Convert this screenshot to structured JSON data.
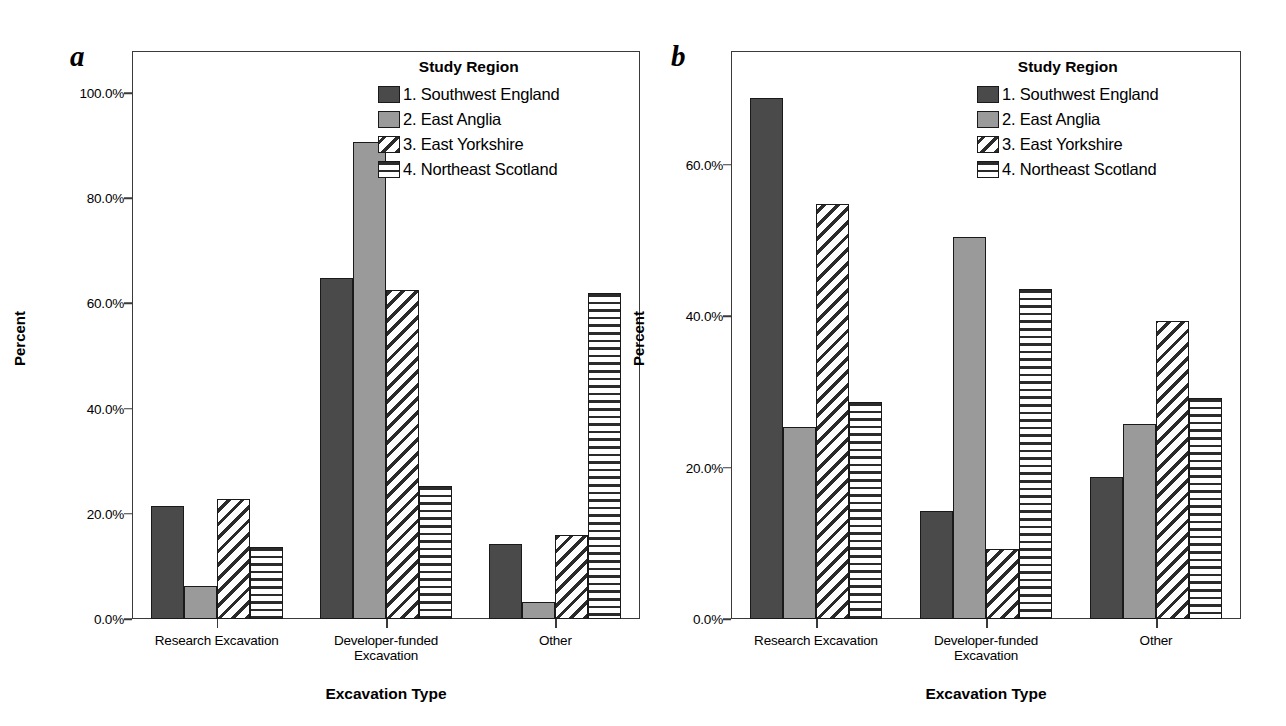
{
  "figure": {
    "panels": [
      {
        "letter": "a",
        "legend_title": "Study Region",
        "axis_title_y": "Percent",
        "axis_title_x": "Excavation Type"
      },
      {
        "letter": "b",
        "legend_title": "Study Region",
        "axis_title_y": "Percent",
        "axis_title_x": "Excavation Type"
      }
    ],
    "series_labels": [
      "1. Southwest England",
      "2. East Anglia",
      "3. East Yorkshire",
      "4. Northeast Scotland"
    ],
    "series_patterns": [
      "solid-dark",
      "solid-light",
      "diagonal-hatch",
      "horizontal-hatch"
    ],
    "colors": {
      "series1": "#4a4a4a",
      "series2": "#9a9a9a",
      "hatch": "#2b2b2b",
      "frame": "#3a3a3a",
      "bar_outline": "#1a1a1a",
      "background": "#ffffff"
    }
  },
  "chart_data": [
    {
      "type": "bar",
      "panel": "a",
      "title": "",
      "xlabel": "Excavation Type",
      "ylabel": "Percent",
      "categories": [
        "Research Excavation",
        "Developer-funded\nExcavation",
        "Other"
      ],
      "legend_title": "Study Region",
      "legend_position": "top-right inside",
      "grid": false,
      "ylim": [
        0,
        108
      ],
      "yticks": [
        0,
        20,
        40,
        60,
        80,
        100
      ],
      "ytick_labels": [
        "0.0%",
        "20.0%",
        "40.0%",
        "60.0%",
        "80.0%",
        "100.0%"
      ],
      "series": [
        {
          "name": "1. Southwest England",
          "values": [
            21.4,
            64.8,
            14.3
          ]
        },
        {
          "name": "2. East Anglia",
          "values": [
            6.3,
            90.7,
            3.3
          ]
        },
        {
          "name": "3. East Yorkshire",
          "values": [
            22.8,
            62.6,
            15.9
          ]
        },
        {
          "name": "4. Northeast Scotland",
          "values": [
            13.7,
            25.2,
            62.0
          ]
        }
      ]
    },
    {
      "type": "bar",
      "panel": "b",
      "title": "",
      "xlabel": "Excavation Type",
      "ylabel": "Percent",
      "categories": [
        "Research Excavation",
        "Developer-funded\nExcavation",
        "Other"
      ],
      "legend_title": "Study Region",
      "legend_position": "top-right inside",
      "grid": false,
      "ylim": [
        0,
        75
      ],
      "yticks": [
        0,
        20,
        40,
        60
      ],
      "ytick_labels": [
        "0.0%",
        "20.0%",
        "40.0%",
        "60.0%"
      ],
      "series": [
        {
          "name": "1. Southwest England",
          "values": [
            68.8,
            14.3,
            18.8
          ]
        },
        {
          "name": "2. East Anglia",
          "values": [
            25.4,
            50.5,
            25.7
          ]
        },
        {
          "name": "3. East Yorkshire",
          "values": [
            54.8,
            9.2,
            39.3
          ]
        },
        {
          "name": "4. Northeast Scotland",
          "values": [
            28.7,
            43.6,
            29.2
          ]
        }
      ]
    }
  ]
}
